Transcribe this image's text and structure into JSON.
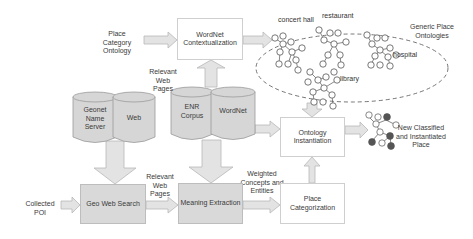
{
  "diagram": {
    "inputs": {
      "place_category_ontology": "Place Category Ontology",
      "collected_poi": "Collected POI"
    },
    "processes": {
      "wordnet_contextualization": "WordNet Contextualization",
      "geo_web_search": "Geo Web Search",
      "meaning_extraction": "Meaning Extraction",
      "place_categorization": "Place Categorization",
      "ontology_instantiation": "Ontology Instantiation"
    },
    "data_stores": {
      "geonet_name_server": "Geonet Name Server",
      "web": "Web",
      "enr_corpus": "ENR Corpus",
      "wordnet": "WordNet"
    },
    "edge_labels": {
      "relevant_web_pages_top": "Relevant Web Pages",
      "relevant_web_pages_bottom": "Relevant Web Pages",
      "weighted_concepts": "Weighted Concepts and Entities"
    },
    "ontologies": {
      "group_label": "Generic Place Ontologies",
      "trees": [
        "concert hall",
        "restaurant",
        "hospital",
        "library"
      ]
    },
    "output": {
      "label": "New Classified and Instantiated Place"
    },
    "colors": {
      "arrow_fill": "#e3e3e3",
      "arrow_stroke": "#b8b8b8",
      "shaded_box": "#d9d9d9",
      "cylinder_fill": "#d6d6d6",
      "node_filled": "#555555"
    }
  }
}
